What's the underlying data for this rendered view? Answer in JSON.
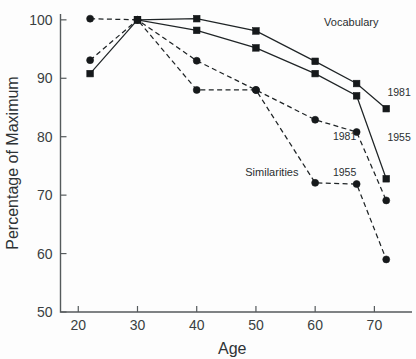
{
  "chart_data": {
    "type": "line",
    "title": "",
    "xlabel": "Age",
    "ylabel": "Percentage of Maximum",
    "xlim": [
      17,
      75
    ],
    "ylim": [
      50,
      101
    ],
    "xticks": [
      20,
      30,
      40,
      50,
      60,
      70
    ],
    "yticks": [
      50,
      60,
      70,
      80,
      90,
      100
    ],
    "xtick_labels": [
      "20",
      "30",
      "40",
      "50",
      "60",
      "70"
    ],
    "ytick_labels": [
      "50",
      "60",
      "70",
      "80",
      "90",
      "100"
    ],
    "grid": false,
    "legend": "inline-annotations",
    "x": [
      22,
      30,
      40,
      50,
      60,
      67,
      72
    ],
    "series": [
      {
        "name": "Vocabulary 1955",
        "group": "Vocabulary",
        "year": "1955",
        "marker": "square",
        "linestyle": "solid",
        "values": [
          90.8,
          100,
          98.2,
          95.2,
          90.8,
          87.0,
          72.8
        ]
      },
      {
        "name": "Vocabulary 1981",
        "group": "Vocabulary",
        "year": "1981",
        "marker": "square",
        "linestyle": "solid",
        "values": [
          null,
          100,
          100.2,
          98.1,
          92.9,
          89.1,
          84.8
        ]
      },
      {
        "name": "Similarities 1981",
        "group": "Similarities",
        "year": "1981",
        "marker": "circle",
        "linestyle": "dashed",
        "values": [
          93.1,
          100,
          93.0,
          88.0,
          82.9,
          80.8,
          69.1
        ]
      },
      {
        "name": "Similarities 1955",
        "group": "Similarities",
        "year": "1955",
        "marker": "circle",
        "linestyle": "dashed",
        "values": [
          100.2,
          100,
          88.0,
          88.0,
          72.1,
          71.9,
          59.0
        ]
      }
    ],
    "annotations": [
      {
        "id": "vocabulary-group-label",
        "text": "Vocabulary",
        "x": 61.5,
        "y": 99.0
      },
      {
        "id": "similarities-group-label",
        "text": "Similarities",
        "x": 48.2,
        "y": 73.2
      },
      {
        "id": "vocab-1981-label",
        "text": "1981",
        "x": 72.2,
        "y": 87.0
      },
      {
        "id": "vocab-1955-label",
        "text": "1955",
        "x": 72.2,
        "y": 79.3
      },
      {
        "id": "sim-1981-label",
        "text": "1981",
        "x": 63.0,
        "y": 79.4
      },
      {
        "id": "sim-1955-label",
        "text": "1955",
        "x": 63.0,
        "y": 73.3
      }
    ]
  }
}
